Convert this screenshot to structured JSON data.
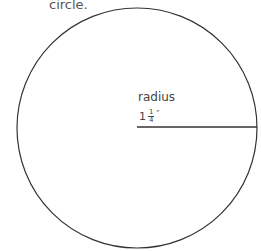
{
  "caption": "circle.",
  "diagram": {
    "shape": "circle",
    "center": [
      137,
      128
    ],
    "radius_px": 120,
    "stroke_color": "#333333",
    "radius_line": {
      "from": [
        137,
        127
      ],
      "to": [
        257,
        127
      ]
    },
    "label": "radius",
    "measurement": {
      "whole": "1",
      "numerator": "1",
      "denominator": "4",
      "unit": "″"
    }
  }
}
